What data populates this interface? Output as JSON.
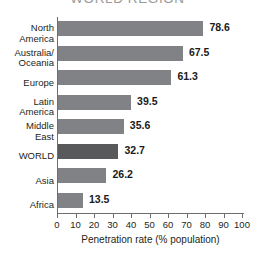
{
  "chart_data": {
    "type": "bar",
    "orientation": "horizontal",
    "title": "WORLD REGION",
    "xlabel": "Penetration rate (% population)",
    "ylabel": "",
    "xlim": [
      0,
      100
    ],
    "xticks": [
      0,
      10,
      20,
      30,
      40,
      50,
      60,
      70,
      80,
      90,
      100
    ],
    "grid": false,
    "legend": null,
    "categories": [
      "North\nAmerica",
      "Australia/\nOceania",
      "Europe",
      "Latin\nAmerica",
      "Middle\nEast",
      "WORLD",
      "Asia",
      "Africa"
    ],
    "values": [
      78.6,
      67.5,
      61.3,
      39.5,
      35.6,
      32.7,
      26.2,
      13.5
    ],
    "value_labels": [
      "78.6",
      "67.5",
      "61.3",
      "39.5",
      "35.6",
      "32.7",
      "26.2",
      "13.5"
    ],
    "highlight_index": 5,
    "colors": {
      "bar": "#808285",
      "bar_highlight": "#58595b",
      "axis": "#6d6e71",
      "text": "#231f20",
      "title": "#9a9a9a",
      "background": "#ffffff"
    }
  }
}
